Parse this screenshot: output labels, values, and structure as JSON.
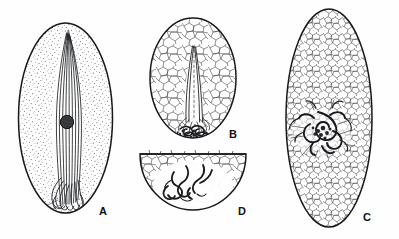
{
  "figure": {
    "background_color": "#ffffff",
    "ink_color": "#1a1a1a",
    "width": 399,
    "height": 239,
    "caption_fragment": ""
  },
  "panels": [
    {
      "id": "A",
      "label": "A",
      "shape": "ellipse",
      "texture": "stipple",
      "description": "Oval cyst filled with fine stippling containing a vertical bundle of wavy longitudinal fibres and a single dark round nucleus near mid-height; fibre bundle splays into loops at the base.",
      "cx": 65.5,
      "cy": 118,
      "rx": 48,
      "ry": 96,
      "label_x": 99,
      "label_y": 205,
      "nucleus": {
        "cx": 67,
        "cy": 122,
        "r": 6.5,
        "fill": "#3a3a3a"
      },
      "fiber_count": 9
    },
    {
      "id": "B",
      "label": "B",
      "shape": "ellipse",
      "texture": "cells",
      "description": "Smaller oval with polygonal cellular texture; a pair of tapering strands run from the upper interior down to a dark coiled mass at the base.",
      "cx": 193,
      "cy": 78,
      "rx": 44,
      "ry": 61,
      "label_x": 229,
      "label_y": 128,
      "coil": {
        "cx": 194,
        "cy": 129,
        "rx": 17,
        "ry": 8
      }
    },
    {
      "id": "C",
      "label": "C",
      "shape": "ellipse",
      "texture": "cells",
      "description": "Large oval with dense polygonal cellular texture; a dark, tightly tangled coiled worm occupies the centre with looping projections.",
      "cx": 329,
      "cy": 118,
      "rx": 44,
      "ry": 110,
      "label_x": 363,
      "label_y": 211,
      "tangle": {
        "cx": 322,
        "cy": 133
      }
    },
    {
      "id": "D",
      "label": "D",
      "shape": "half-ellipse-bowl",
      "texture": "cells",
      "description": "Bowl-shaped (flat-topped) half oval with polygonal cellular texture along the rim; several loose squiggly worm-like strands lie in the open centre.",
      "cx": 193,
      "cy": 158,
      "rx": 53,
      "ry": 52,
      "label_x": 238,
      "label_y": 205
    }
  ]
}
